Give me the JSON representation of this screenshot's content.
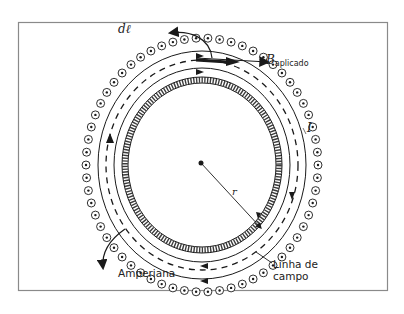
{
  "diagram": {
    "type": "ampere-law-toroid-cross-section",
    "labels": {
      "dl": "dℓ",
      "b_applied_symbol": "B",
      "b_applied_subscript": "aplicado",
      "current": "I",
      "radius": "r",
      "amperian": "Amperiana",
      "field_line_line1": "Linha de",
      "field_line_line2": "campo"
    },
    "elements": {
      "outer_wire_ring": "current out-of-page symbols (dot in circle)",
      "inner_wire_ring": "hatched / cross-hatched inner winding",
      "field_lines": [
        "outer solid circle",
        "inner solid circle"
      ],
      "amperian_loop": "dashed circle",
      "arrows": [
        "dℓ tangent arrow",
        "B applied arrow",
        "field line direction arrows"
      ]
    },
    "colors": {
      "ink": "#1a1a1a",
      "frame": "#8a8a8a",
      "background": "#ffffff"
    }
  }
}
